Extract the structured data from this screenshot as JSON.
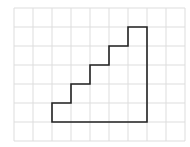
{
  "diagram": {
    "type": "grid-figure",
    "grid": {
      "columns": 9,
      "rows": 7,
      "origin_x": 14,
      "origin_y": 8,
      "cell_size": 19,
      "line_color": "#dddddd"
    },
    "shape": {
      "name": "staircase",
      "stroke_color": "#222222",
      "stroke_width": 1.6,
      "vertices_grid": [
        [
          2,
          6
        ],
        [
          7,
          6
        ],
        [
          7,
          1
        ],
        [
          6,
          1
        ],
        [
          6,
          2
        ],
        [
          5,
          2
        ],
        [
          5,
          3
        ],
        [
          4,
          3
        ],
        [
          4,
          4
        ],
        [
          3,
          4
        ],
        [
          3,
          5
        ],
        [
          2,
          5
        ]
      ]
    }
  }
}
